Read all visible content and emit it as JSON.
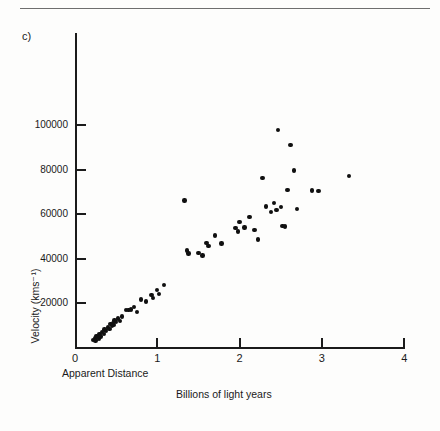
{
  "panel_label": "c)",
  "chart_data": {
    "type": "scatter",
    "title": "",
    "panel": "c)",
    "xlabel": "Apparent Distance",
    "xlabel_units": "Billions of light years",
    "ylabel": "Velocity (kms⁻¹)",
    "xlim": [
      0,
      4.15
    ],
    "ylim": [
      0,
      111000
    ],
    "xticks": [
      0,
      1,
      2,
      3,
      4
    ],
    "xtick_labels": [
      "0",
      "1",
      "2",
      "3",
      "4"
    ],
    "yticks": [
      20000,
      40000,
      60000,
      80000,
      100000
    ],
    "ytick_labels": [
      "20000",
      "40000",
      "60000",
      "80000",
      "100000"
    ],
    "grid": false,
    "legend": false,
    "marker_color": "#101010",
    "axis_color": "#1b1b1b",
    "points": [
      [
        0.22,
        3500
      ],
      [
        0.24,
        4200
      ],
      [
        0.25,
        3100
      ],
      [
        0.26,
        5200
      ],
      [
        0.27,
        4600
      ],
      [
        0.29,
        3900
      ],
      [
        0.3,
        6100
      ],
      [
        0.31,
        5000
      ],
      [
        0.33,
        7000
      ],
      [
        0.35,
        6200
      ],
      [
        0.36,
        8100
      ],
      [
        0.38,
        7400
      ],
      [
        0.4,
        9000
      ],
      [
        0.42,
        8200
      ],
      [
        0.43,
        10500
      ],
      [
        0.45,
        9600
      ],
      [
        0.46,
        11000
      ],
      [
        0.47,
        10000
      ],
      [
        0.48,
        12200
      ],
      [
        0.5,
        11500
      ],
      [
        0.52,
        13000
      ],
      [
        0.55,
        12000
      ],
      [
        0.57,
        14000
      ],
      [
        0.62,
        16800
      ],
      [
        0.65,
        16900
      ],
      [
        0.68,
        17000
      ],
      [
        0.72,
        18100
      ],
      [
        0.75,
        15900
      ],
      [
        0.8,
        21500
      ],
      [
        0.86,
        20600
      ],
      [
        0.93,
        23600
      ],
      [
        0.95,
        22300
      ],
      [
        1.0,
        25900
      ],
      [
        1.02,
        24100
      ],
      [
        1.08,
        28200
      ],
      [
        1.33,
        66000
      ],
      [
        1.36,
        43600
      ],
      [
        1.38,
        42200
      ],
      [
        1.5,
        42400
      ],
      [
        1.55,
        41300
      ],
      [
        1.6,
        47000
      ],
      [
        1.62,
        45500
      ],
      [
        1.7,
        50400
      ],
      [
        1.78,
        46800
      ],
      [
        1.95,
        53800
      ],
      [
        1.98,
        52200
      ],
      [
        2.0,
        56500
      ],
      [
        2.06,
        54000
      ],
      [
        2.12,
        58600
      ],
      [
        2.18,
        52800
      ],
      [
        2.22,
        48600
      ],
      [
        2.28,
        76200
      ],
      [
        2.32,
        63400
      ],
      [
        2.38,
        60900
      ],
      [
        2.42,
        64900
      ],
      [
        2.45,
        61900
      ],
      [
        2.47,
        97700
      ],
      [
        2.5,
        63200
      ],
      [
        2.52,
        54700
      ],
      [
        2.55,
        54300
      ],
      [
        2.58,
        70800
      ],
      [
        2.62,
        91000
      ],
      [
        2.66,
        79600
      ],
      [
        2.7,
        62200
      ],
      [
        2.88,
        70600
      ],
      [
        2.96,
        70400
      ],
      [
        3.33,
        77000
      ]
    ]
  }
}
